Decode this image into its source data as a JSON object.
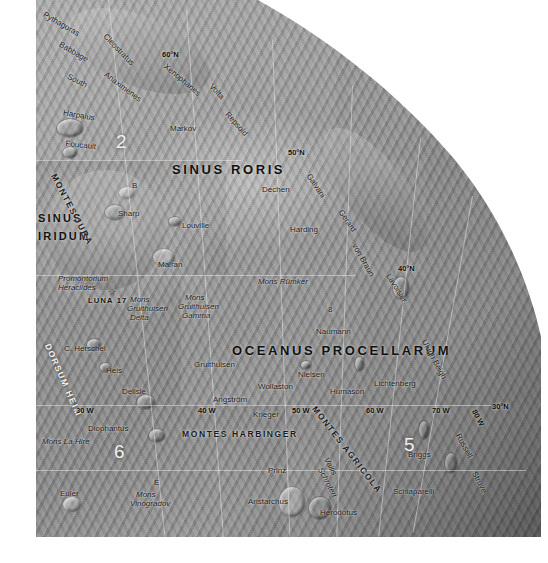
{
  "map": {
    "title": "Lunar Nearside Northwest Quadrant",
    "body": "Moon",
    "projection": "orthographic",
    "background_color": "#ffffff",
    "surface_color": "#9a9a9a"
  },
  "graticule": {
    "latitude_labels": [
      {
        "text": "60°N",
        "x": 162,
        "y": 50
      },
      {
        "text": "50°N",
        "x": 288,
        "y": 148
      },
      {
        "text": "40°N",
        "x": 398,
        "y": 264
      },
      {
        "text": "30°N",
        "x": 492,
        "y": 402
      }
    ],
    "longitude_labels": [
      {
        "text": "30 W",
        "x": 76,
        "y": 406
      },
      {
        "text": "40 W",
        "x": 198,
        "y": 406
      },
      {
        "text": "50 W",
        "x": 292,
        "y": 406
      },
      {
        "text": "60 W",
        "x": 366,
        "y": 406
      },
      {
        "text": "70 W",
        "x": 432,
        "y": 406
      },
      {
        "text": "80 W",
        "x": 478,
        "y": 408
      }
    ]
  },
  "maria": [
    {
      "name": "SINUS RORIS",
      "x": 172,
      "y": 162,
      "size": "large"
    },
    {
      "name": "SINUS",
      "x": 38,
      "y": 212,
      "size": "small"
    },
    {
      "name": "IRIDUM",
      "x": 38,
      "y": 230,
      "size": "small"
    },
    {
      "name": "OCEANUS PROCELLARUM",
      "x": 232,
      "y": 343,
      "size": "large"
    }
  ],
  "mountain_ranges": [
    {
      "name": "MONTES JURA",
      "x": 58,
      "y": 172,
      "rotation": 62
    },
    {
      "name": "MONTES HARBINGER",
      "x": 182,
      "y": 429
    },
    {
      "name": "MONTES AGRICOLA",
      "x": 318,
      "y": 404,
      "rotation": 52
    },
    {
      "name": "DORSUM HEIM",
      "x": 52,
      "y": 342,
      "rotation": 66
    }
  ],
  "craters": [
    {
      "name": "Pythagoras",
      "x": 46,
      "y": 10,
      "rotation": 30,
      "italic": false
    },
    {
      "name": "Babbage",
      "x": 62,
      "y": 40,
      "rotation": 30,
      "italic": false
    },
    {
      "name": "South",
      "x": 70,
      "y": 72,
      "rotation": 27,
      "italic": false
    },
    {
      "name": "Cleostratus",
      "x": 108,
      "y": 32,
      "rotation": 46,
      "italic": false
    },
    {
      "name": "Anaximenes",
      "x": 108,
      "y": 70,
      "rotation": 37,
      "italic": false
    },
    {
      "name": "Xenophanes",
      "x": 168,
      "y": 62,
      "rotation": 40,
      "italic": false
    },
    {
      "name": "Volta",
      "x": 214,
      "y": 82,
      "rotation": 47,
      "italic": false
    },
    {
      "name": "Repsold",
      "x": 230,
      "y": 110,
      "rotation": 48,
      "italic": false
    },
    {
      "name": "Harpalus",
      "x": 64,
      "y": 108,
      "rotation": 10,
      "italic": false
    },
    {
      "name": "Foucault",
      "x": 66,
      "y": 139,
      "rotation": 6,
      "italic": false
    },
    {
      "name": "Markov",
      "x": 170,
      "y": 124,
      "rotation": 0,
      "italic": false
    },
    {
      "name": "Dechen",
      "x": 262,
      "y": 185,
      "rotation": 0,
      "italic": false
    },
    {
      "name": "Galvani",
      "x": 312,
      "y": 172,
      "rotation": 56,
      "italic": false
    },
    {
      "name": "Gerard",
      "x": 344,
      "y": 208,
      "rotation": 56,
      "italic": false
    },
    {
      "name": "von Braun",
      "x": 358,
      "y": 242,
      "rotation": 60,
      "italic": false
    },
    {
      "name": "Lavoisier",
      "x": 392,
      "y": 272,
      "rotation": 58,
      "italic": false
    },
    {
      "name": "Harding",
      "x": 290,
      "y": 225,
      "rotation": 0,
      "italic": false
    },
    {
      "name": "B",
      "x": 132,
      "y": 181,
      "rotation": 0,
      "italic": false
    },
    {
      "name": "Sharp",
      "x": 118,
      "y": 209,
      "rotation": 0,
      "italic": false
    },
    {
      "name": "Louville",
      "x": 182,
      "y": 221,
      "rotation": 0,
      "italic": false
    },
    {
      "name": "Mairan",
      "x": 158,
      "y": 260,
      "rotation": 0,
      "italic": false
    },
    {
      "name": "Mons Rümker",
      "x": 258,
      "y": 277,
      "rotation": 0,
      "italic": true
    },
    {
      "name": "8",
      "x": 328,
      "y": 305,
      "rotation": 0,
      "italic": false
    },
    {
      "name": "Naumann",
      "x": 316,
      "y": 327,
      "rotation": 0,
      "italic": false
    },
    {
      "name": "Ulugh Beigh",
      "x": 428,
      "y": 338,
      "rotation": 62,
      "italic": false
    },
    {
      "name": "Promontorium",
      "x": 58,
      "y": 274,
      "rotation": 0,
      "italic": true
    },
    {
      "name": "Heraclides",
      "x": 58,
      "y": 283,
      "rotation": 0,
      "italic": true
    },
    {
      "name": "Mons",
      "x": 130,
      "y": 295,
      "rotation": 0,
      "italic": true
    },
    {
      "name": "Gruithuisen",
      "x": 127,
      "y": 304,
      "rotation": 0,
      "italic": true
    },
    {
      "name": "Delta",
      "x": 130,
      "y": 313,
      "rotation": 0,
      "italic": true
    },
    {
      "name": "Mons",
      "x": 185,
      "y": 293,
      "rotation": 0,
      "italic": true
    },
    {
      "name": "Gruithuisen",
      "x": 178,
      "y": 302,
      "rotation": 0,
      "italic": true
    },
    {
      "name": "Gamma",
      "x": 182,
      "y": 311,
      "rotation": 0,
      "italic": true
    },
    {
      "name": "Gruithuisen",
      "x": 194,
      "y": 360,
      "rotation": 0,
      "italic": false
    },
    {
      "name": "C. Herschel",
      "x": 64,
      "y": 344,
      "rotation": 0,
      "italic": false
    },
    {
      "name": "Heis",
      "x": 106,
      "y": 366,
      "rotation": 0,
      "italic": false
    },
    {
      "name": "Delisle",
      "x": 122,
      "y": 387,
      "rotation": 0,
      "italic": false
    },
    {
      "name": "Diophantus",
      "x": 88,
      "y": 424,
      "rotation": 0,
      "italic": false
    },
    {
      "name": "Euler",
      "x": 60,
      "y": 489,
      "rotation": 0,
      "italic": false
    },
    {
      "name": "Mons",
      "x": 136,
      "y": 490,
      "rotation": 0,
      "italic": true
    },
    {
      "name": "Vinogradov",
      "x": 130,
      "y": 499,
      "rotation": 0,
      "italic": true
    },
    {
      "name": "E",
      "x": 154,
      "y": 478,
      "rotation": 0,
      "italic": false
    },
    {
      "name": "Mons La Hire",
      "x": 42,
      "y": 437,
      "rotation": 0,
      "italic": true
    },
    {
      "name": "Angström",
      "x": 213,
      "y": 395,
      "rotation": 0,
      "italic": false
    },
    {
      "name": "Krieger",
      "x": 253,
      "y": 410,
      "rotation": 0,
      "italic": false
    },
    {
      "name": "Wollaston",
      "x": 258,
      "y": 382,
      "rotation": 0,
      "italic": false
    },
    {
      "name": "Nielsen",
      "x": 298,
      "y": 370,
      "rotation": 0,
      "italic": false
    },
    {
      "name": "Humason",
      "x": 330,
      "y": 387,
      "rotation": 0,
      "italic": false
    },
    {
      "name": "Lichtenberg",
      "x": 374,
      "y": 379,
      "rotation": 0,
      "italic": false
    },
    {
      "name": "Prinz",
      "x": 268,
      "y": 466,
      "rotation": 0,
      "italic": false
    },
    {
      "name": "Vallis",
      "x": 330,
      "y": 456,
      "rotation": 62,
      "italic": true
    },
    {
      "name": "Schroteri",
      "x": 324,
      "y": 466,
      "rotation": 62,
      "italic": true
    },
    {
      "name": "Aristarchus",
      "x": 248,
      "y": 497,
      "rotation": 0,
      "italic": false
    },
    {
      "name": "Herodotus",
      "x": 320,
      "y": 508,
      "rotation": 0,
      "italic": false
    },
    {
      "name": "Schiaparelli",
      "x": 393,
      "y": 487,
      "rotation": 0,
      "italic": false
    },
    {
      "name": "Briggs",
      "x": 408,
      "y": 450,
      "rotation": 0,
      "italic": false
    },
    {
      "name": "Russell",
      "x": 462,
      "y": 432,
      "rotation": 62,
      "italic": false
    },
    {
      "name": "Struve",
      "x": 478,
      "y": 470,
      "rotation": 62,
      "italic": false
    }
  ],
  "region_numbers": [
    {
      "label": "2",
      "x": 116,
      "y": 131
    },
    {
      "label": "6",
      "x": 114,
      "y": 441
    },
    {
      "label": "5",
      "x": 404,
      "y": 434
    }
  ],
  "landing_sites": [
    {
      "label": "LUNA 17",
      "x": 88,
      "y": 296,
      "marker": "star-icon",
      "marker_x": 108,
      "marker_y": 287
    }
  ]
}
